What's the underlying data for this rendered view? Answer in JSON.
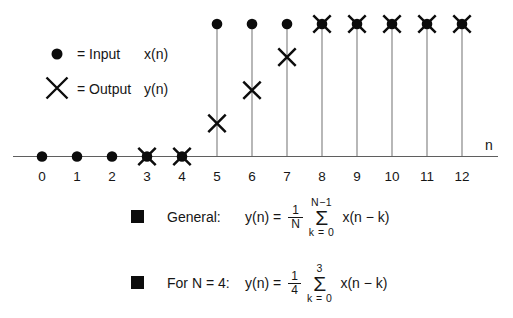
{
  "legend": {
    "input": {
      "eq": "= Input",
      "signal": "x(n)"
    },
    "output": {
      "eq": "= Output",
      "signal": "y(n)"
    }
  },
  "chart_data": {
    "type": "scatter",
    "subtype": "stem",
    "x": [
      0,
      1,
      2,
      3,
      4,
      5,
      6,
      7,
      8,
      9,
      10,
      11,
      12
    ],
    "series": [
      {
        "name": "Input x(n)",
        "marker": "filled-circle",
        "values": [
          0,
          0,
          0,
          0,
          0,
          1,
          1,
          1,
          1,
          1,
          1,
          1,
          1
        ]
      },
      {
        "name": "Output y(n)",
        "marker": "x-cross",
        "values": [
          null,
          null,
          null,
          0,
          0,
          0.25,
          0.5,
          0.75,
          1,
          1,
          1,
          1,
          1
        ]
      }
    ],
    "xlabel": "n",
    "ylim": [
      0,
      1.1
    ],
    "grid": false,
    "legend_position": "upper-left"
  },
  "formulas": [
    {
      "label": "General:",
      "lhs": "y(n) =",
      "frac_num": "1",
      "frac_den": "N",
      "sum_symbol": "Σ",
      "sum_upper": "N−1",
      "sum_lower": "k = 0",
      "rhs": "x(n − k)"
    },
    {
      "label": "For N = 4:",
      "lhs": "y(n) =",
      "frac_num": "1",
      "frac_den": "4",
      "sum_symbol": "Σ",
      "sum_upper": "3",
      "sum_lower": "k = 0",
      "rhs": "x(n − k)"
    }
  ],
  "colors": {
    "ink": "#0c0c0c",
    "stem": "#7d7d7d",
    "axis": "#5f5f5f",
    "background": "#ffffff",
    "text": "#161616"
  }
}
